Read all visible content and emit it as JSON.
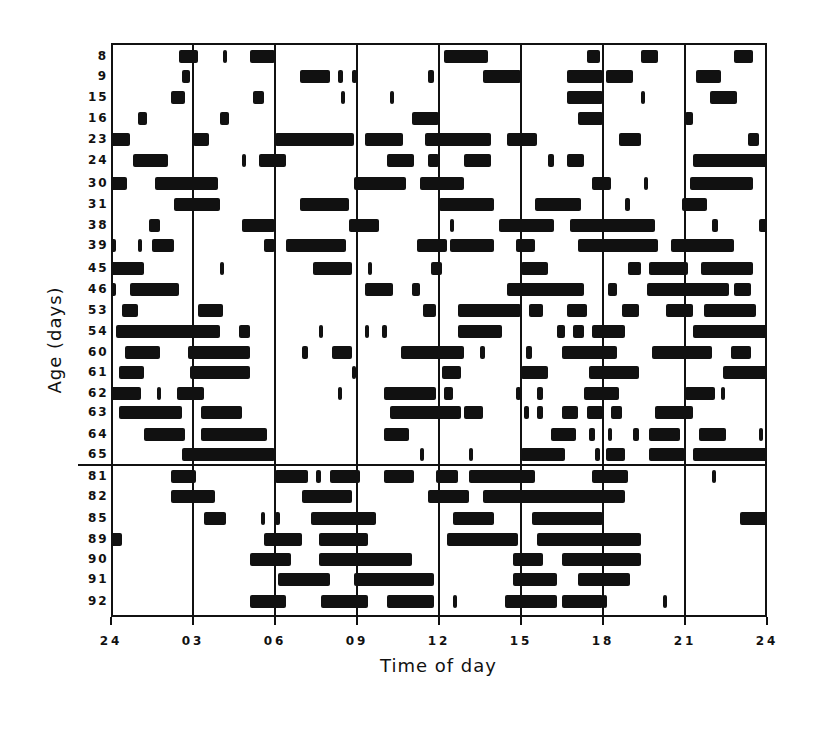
{
  "chart_data": {
    "type": "raster",
    "title": "",
    "xlabel": "Time of day",
    "ylabel": "Age (days)",
    "x_ticks": [
      "24",
      "03",
      "06",
      "09",
      "12",
      "15",
      "18",
      "21",
      "24"
    ],
    "xlim_hours": [
      0,
      24
    ],
    "grid": "vertical lines every 3 h",
    "divider_after_row": "65",
    "rows": [
      {
        "age": "8",
        "bouts": [
          [
            2.5,
            3.2
          ],
          [
            4.1,
            4.2
          ],
          [
            5.1,
            6.0
          ],
          [
            12.2,
            13.8
          ],
          [
            17.4,
            17.9
          ],
          [
            19.4,
            20.0
          ],
          [
            22.8,
            23.5
          ]
        ]
      },
      {
        "age": "9",
        "bouts": [
          [
            2.6,
            2.9
          ],
          [
            6.9,
            8.0
          ],
          [
            8.3,
            8.5
          ],
          [
            8.8,
            9.0
          ],
          [
            11.6,
            11.8
          ],
          [
            13.6,
            15.0
          ],
          [
            16.7,
            18.0
          ],
          [
            18.1,
            19.1
          ],
          [
            21.4,
            22.3
          ]
        ]
      },
      {
        "age": "15",
        "bouts": [
          [
            2.2,
            2.7
          ],
          [
            5.2,
            5.6
          ],
          [
            8.4,
            8.5
          ],
          [
            10.2,
            10.3
          ],
          [
            16.7,
            18.0
          ],
          [
            19.4,
            19.5
          ],
          [
            21.9,
            22.9
          ]
        ]
      },
      {
        "age": "16",
        "bouts": [
          [
            1.0,
            1.3
          ],
          [
            4.0,
            4.3
          ],
          [
            11.0,
            12.0
          ],
          [
            17.1,
            18.0
          ],
          [
            21.0,
            21.3
          ]
        ]
      },
      {
        "age": "23",
        "bouts": [
          [
            0.0,
            0.7
          ],
          [
            3.0,
            3.6
          ],
          [
            6.0,
            8.9
          ],
          [
            9.3,
            10.7
          ],
          [
            11.5,
            13.9
          ],
          [
            14.5,
            15.6
          ],
          [
            18.6,
            19.4
          ],
          [
            23.3,
            23.7
          ]
        ]
      },
      {
        "age": "24",
        "bouts": [
          [
            0.8,
            2.1
          ],
          [
            4.8,
            4.9
          ],
          [
            5.4,
            6.4
          ],
          [
            10.1,
            11.1
          ],
          [
            11.6,
            12.0
          ],
          [
            12.9,
            13.9
          ],
          [
            16.0,
            16.2
          ],
          [
            16.7,
            17.3
          ],
          [
            21.3,
            24.0
          ]
        ]
      },
      {
        "age": "30",
        "bouts": [
          [
            0.0,
            0.6
          ],
          [
            1.6,
            3.9
          ],
          [
            8.9,
            10.8
          ],
          [
            11.3,
            12.9
          ],
          [
            17.6,
            18.3
          ],
          [
            19.5,
            19.6
          ],
          [
            21.2,
            23.5
          ]
        ]
      },
      {
        "age": "31",
        "bouts": [
          [
            2.3,
            4.0
          ],
          [
            6.9,
            8.7
          ],
          [
            12.0,
            14.0
          ],
          [
            15.5,
            17.2
          ],
          [
            18.8,
            19.0
          ],
          [
            20.9,
            21.8
          ]
        ]
      },
      {
        "age": "38",
        "bouts": [
          [
            1.4,
            1.8
          ],
          [
            4.8,
            6.0
          ],
          [
            8.7,
            9.8
          ],
          [
            12.4,
            12.5
          ],
          [
            14.2,
            16.2
          ],
          [
            16.8,
            19.9
          ],
          [
            22.0,
            22.2
          ],
          [
            23.7,
            24.0
          ]
        ]
      },
      {
        "age": "39",
        "bouts": [
          [
            0.0,
            0.2
          ],
          [
            1.0,
            1.1
          ],
          [
            1.5,
            2.3
          ],
          [
            5.6,
            6.0
          ],
          [
            6.4,
            8.6
          ],
          [
            11.2,
            12.3
          ],
          [
            12.4,
            14.0
          ],
          [
            14.8,
            15.5
          ],
          [
            17.1,
            20.0
          ],
          [
            20.5,
            22.8
          ]
        ]
      },
      {
        "age": "45",
        "bouts": [
          [
            0.0,
            1.2
          ],
          [
            4.0,
            4.1
          ],
          [
            7.4,
            8.8
          ],
          [
            9.4,
            9.5
          ],
          [
            11.7,
            12.1
          ],
          [
            15.0,
            16.0
          ],
          [
            18.9,
            19.4
          ],
          [
            19.7,
            21.1
          ],
          [
            21.6,
            23.5
          ]
        ]
      },
      {
        "age": "46",
        "bouts": [
          [
            0.0,
            0.2
          ],
          [
            0.7,
            2.5
          ],
          [
            9.3,
            10.3
          ],
          [
            11.0,
            11.3
          ],
          [
            14.5,
            17.3
          ],
          [
            18.2,
            18.5
          ],
          [
            19.6,
            22.6
          ],
          [
            22.8,
            23.4
          ]
        ]
      },
      {
        "age": "53",
        "bouts": [
          [
            0.4,
            1.0
          ],
          [
            3.2,
            4.1
          ],
          [
            11.4,
            11.9
          ],
          [
            12.7,
            15.0
          ],
          [
            15.3,
            15.8
          ],
          [
            16.7,
            17.4
          ],
          [
            18.7,
            19.3
          ],
          [
            20.3,
            21.3
          ],
          [
            21.7,
            23.6
          ]
        ]
      },
      {
        "age": "54",
        "bouts": [
          [
            0.2,
            4.0
          ],
          [
            4.7,
            5.1
          ],
          [
            7.6,
            7.7
          ],
          [
            9.3,
            9.4
          ],
          [
            9.9,
            10.1
          ],
          [
            12.7,
            14.3
          ],
          [
            16.3,
            16.6
          ],
          [
            16.9,
            17.3
          ],
          [
            17.6,
            18.8
          ],
          [
            21.3,
            24.0
          ]
        ]
      },
      {
        "age": "60",
        "bouts": [
          [
            0.5,
            1.8
          ],
          [
            2.8,
            5.1
          ],
          [
            7.0,
            7.2
          ],
          [
            8.1,
            8.8
          ],
          [
            10.6,
            12.9
          ],
          [
            13.5,
            13.7
          ],
          [
            15.2,
            15.4
          ],
          [
            16.5,
            18.5
          ],
          [
            19.8,
            22.0
          ],
          [
            22.7,
            23.4
          ]
        ]
      },
      {
        "age": "61",
        "bouts": [
          [
            0.3,
            1.2
          ],
          [
            2.9,
            5.1
          ],
          [
            8.8,
            8.9
          ],
          [
            12.1,
            12.8
          ],
          [
            15.0,
            16.0
          ],
          [
            17.5,
            19.3
          ],
          [
            22.4,
            24.0
          ]
        ]
      },
      {
        "age": "62",
        "bouts": [
          [
            0.0,
            1.1
          ],
          [
            1.7,
            1.8
          ],
          [
            2.4,
            3.4
          ],
          [
            8.3,
            8.4
          ],
          [
            10.0,
            11.9
          ],
          [
            12.2,
            12.5
          ],
          [
            14.8,
            15.0
          ],
          [
            15.6,
            15.8
          ],
          [
            17.3,
            18.6
          ],
          [
            21.0,
            22.1
          ],
          [
            22.3,
            22.4
          ]
        ]
      },
      {
        "age": "63",
        "bouts": [
          [
            0.3,
            2.6
          ],
          [
            3.3,
            4.8
          ],
          [
            10.2,
            12.8
          ],
          [
            12.9,
            13.6
          ],
          [
            15.1,
            15.3
          ],
          [
            15.6,
            15.8
          ],
          [
            16.5,
            17.1
          ],
          [
            17.4,
            18.0
          ],
          [
            18.3,
            18.7
          ],
          [
            19.9,
            21.3
          ]
        ]
      },
      {
        "age": "64",
        "bouts": [
          [
            1.2,
            2.7
          ],
          [
            3.3,
            5.7
          ],
          [
            10.0,
            10.9
          ],
          [
            16.1,
            17.0
          ],
          [
            17.5,
            17.7
          ],
          [
            18.2,
            18.3
          ],
          [
            19.1,
            19.3
          ],
          [
            19.7,
            20.8
          ],
          [
            21.5,
            22.5
          ],
          [
            23.7,
            23.8
          ]
        ]
      },
      {
        "age": "65",
        "bouts": [
          [
            2.6,
            6.0
          ],
          [
            11.3,
            11.4
          ],
          [
            13.1,
            13.2
          ],
          [
            15.0,
            16.6
          ],
          [
            17.7,
            17.9
          ],
          [
            18.1,
            18.8
          ],
          [
            19.7,
            21.0
          ],
          [
            21.3,
            24.0
          ]
        ]
      },
      {
        "age": "81",
        "bouts": [
          [
            2.2,
            3.1
          ],
          [
            6.0,
            7.2
          ],
          [
            7.5,
            7.7
          ],
          [
            8.0,
            9.1
          ],
          [
            10.0,
            11.1
          ],
          [
            11.9,
            12.7
          ],
          [
            13.1,
            15.5
          ],
          [
            17.6,
            18.9
          ],
          [
            22.0,
            22.1
          ]
        ]
      },
      {
        "age": "82",
        "bouts": [
          [
            2.2,
            3.8
          ],
          [
            7.0,
            8.8
          ],
          [
            11.6,
            13.1
          ],
          [
            13.6,
            18.8
          ]
        ]
      },
      {
        "age": "85",
        "bouts": [
          [
            3.4,
            4.2
          ],
          [
            5.5,
            5.6
          ],
          [
            6.0,
            6.2
          ],
          [
            7.3,
            9.7
          ],
          [
            12.5,
            14.0
          ],
          [
            15.4,
            18.0
          ],
          [
            23.0,
            24.0
          ]
        ]
      },
      {
        "age": "89",
        "bouts": [
          [
            0.0,
            0.4
          ],
          [
            5.6,
            7.0
          ],
          [
            7.6,
            9.4
          ],
          [
            12.3,
            14.9
          ],
          [
            15.6,
            19.4
          ]
        ]
      },
      {
        "age": "90",
        "bouts": [
          [
            5.1,
            6.6
          ],
          [
            7.6,
            11.0
          ],
          [
            14.7,
            15.8
          ],
          [
            16.5,
            19.4
          ]
        ]
      },
      {
        "age": "91",
        "bouts": [
          [
            6.1,
            8.0
          ],
          [
            8.9,
            11.8
          ],
          [
            14.7,
            16.3
          ],
          [
            17.1,
            19.0
          ]
        ]
      },
      {
        "age": "92",
        "bouts": [
          [
            5.1,
            6.4
          ],
          [
            7.7,
            9.4
          ],
          [
            10.1,
            11.8
          ],
          [
            12.5,
            12.6
          ],
          [
            14.4,
            16.3
          ],
          [
            16.5,
            18.0
          ],
          [
            18.0,
            18.1
          ],
          [
            20.2,
            20.3
          ]
        ]
      }
    ]
  }
}
